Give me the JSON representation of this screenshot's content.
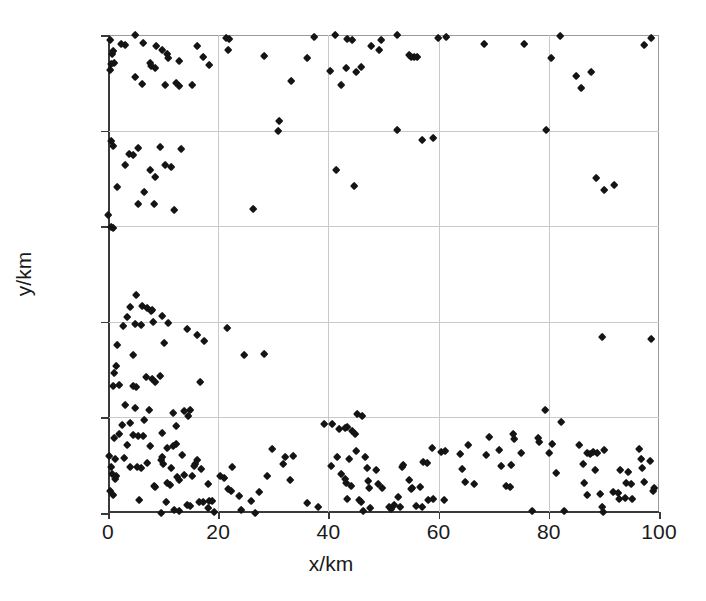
{
  "chart_data": {
    "type": "scatter",
    "title": "",
    "xlabel": "x/km",
    "ylabel": "y/km",
    "xlim": [
      0,
      100
    ],
    "ylim": [
      0,
      100
    ],
    "xticks": [
      0,
      20,
      40,
      60,
      80,
      100
    ],
    "yticks": [
      0,
      20,
      40,
      60,
      80,
      100
    ],
    "xticklabels": [
      "0",
      "20",
      "40",
      "60",
      "80",
      "100"
    ],
    "yticklabels": [
      "0",
      "20",
      "40",
      "60",
      "80",
      "100"
    ],
    "grid": true,
    "legend": null,
    "marker": "diamond",
    "marker_color": "#141414",
    "n_points": 303,
    "series": [
      {
        "name": "points",
        "points": [
          [
            0.4,
            99.0
          ],
          [
            0.9,
            96.6
          ],
          [
            0.7,
            95.9
          ],
          [
            1.1,
            94.2
          ],
          [
            0.5,
            93.8
          ],
          [
            0.4,
            92.6
          ],
          [
            2.4,
            98.0
          ],
          [
            3.2,
            97.9
          ],
          [
            4.9,
            100.0
          ],
          [
            6.3,
            98.2
          ],
          [
            8.8,
            97.6
          ],
          [
            9.9,
            96.8
          ],
          [
            10.8,
            95.9
          ],
          [
            11.0,
            95.2
          ],
          [
            7.7,
            94.2
          ],
          [
            7.9,
            93.4
          ],
          [
            8.6,
            93.0
          ],
          [
            12.9,
            94.6
          ],
          [
            16.2,
            97.6
          ],
          [
            17.3,
            95.4
          ],
          [
            18.4,
            93.6
          ],
          [
            21.4,
            99.4
          ],
          [
            22.0,
            99.2
          ],
          [
            21.8,
            96.8
          ],
          [
            5.0,
            91.2
          ],
          [
            6.2,
            89.7
          ],
          [
            10.3,
            89.4
          ],
          [
            12.4,
            90.0
          ],
          [
            15.2,
            89.6
          ],
          [
            12.9,
            89.2
          ],
          [
            28.4,
            95.6
          ],
          [
            33.3,
            90.3
          ],
          [
            37.4,
            99.5
          ],
          [
            36.2,
            95.2
          ],
          [
            41.3,
            100.0
          ],
          [
            43.5,
            99.2
          ],
          [
            44.4,
            98.9
          ],
          [
            47.8,
            97.6
          ],
          [
            49.6,
            99.0
          ],
          [
            49.3,
            96.9
          ],
          [
            43.2,
            93.0
          ],
          [
            46.0,
            93.2
          ],
          [
            52.4,
            100.0
          ],
          [
            59.9,
            99.4
          ],
          [
            61.3,
            99.5
          ],
          [
            54.6,
            95.7
          ],
          [
            55.0,
            95.3
          ],
          [
            55.6,
            95.4
          ],
          [
            56.2,
            95.4
          ],
          [
            68.2,
            98.0
          ],
          [
            75.5,
            98.0
          ],
          [
            82.0,
            99.7
          ],
          [
            80.4,
            95.1
          ],
          [
            84.9,
            91.4
          ],
          [
            85.8,
            88.8
          ],
          [
            87.7,
            92.3
          ],
          [
            98.5,
            99.4
          ],
          [
            97.4,
            97.8
          ],
          [
            40.4,
            92.4
          ],
          [
            45.1,
            92.2
          ],
          [
            42.4,
            89.5
          ],
          [
            31.0,
            82.0
          ],
          [
            30.9,
            79.8
          ],
          [
            52.5,
            80.0
          ],
          [
            79.6,
            80.1
          ],
          [
            57.0,
            78.0
          ],
          [
            59.0,
            78.4
          ],
          [
            0.5,
            77.8
          ],
          [
            1.0,
            76.7
          ],
          [
            5.4,
            76.3
          ],
          [
            9.5,
            76.6
          ],
          [
            13.2,
            76.2
          ],
          [
            3.9,
            75.0
          ],
          [
            4.6,
            74.8
          ],
          [
            3.1,
            72.8
          ],
          [
            10.4,
            72.8
          ],
          [
            11.5,
            72.4
          ],
          [
            7.6,
            71.8
          ],
          [
            8.6,
            70.3
          ],
          [
            41.4,
            71.8
          ],
          [
            1.7,
            68.2
          ],
          [
            6.6,
            67.2
          ],
          [
            44.6,
            68.4
          ],
          [
            5.4,
            64.6
          ],
          [
            8.4,
            64.6
          ],
          [
            12.0,
            63.4
          ],
          [
            26.4,
            63.6
          ],
          [
            0.1,
            62.2
          ],
          [
            0.5,
            59.8
          ],
          [
            0.9,
            59.6
          ],
          [
            88.6,
            70.0
          ],
          [
            90.0,
            67.5
          ],
          [
            91.8,
            68.6
          ],
          [
            5.2,
            45.6
          ],
          [
            4.0,
            43.0
          ],
          [
            6.2,
            43.2
          ],
          [
            7.1,
            42.8
          ],
          [
            8.0,
            42.4
          ],
          [
            7.9,
            42.2
          ],
          [
            3.5,
            41.0
          ],
          [
            9.8,
            41.2
          ],
          [
            2.8,
            39.0
          ],
          [
            5.0,
            39.4
          ],
          [
            6.0,
            39.3
          ],
          [
            8.2,
            39.9
          ],
          [
            11.0,
            39.8
          ],
          [
            14.3,
            38.4
          ],
          [
            16.2,
            37.3
          ],
          [
            21.7,
            38.6
          ],
          [
            1.6,
            35.2
          ],
          [
            10.2,
            35.6
          ],
          [
            17.5,
            35.9
          ],
          [
            4.6,
            33.0
          ],
          [
            24.7,
            33.0
          ],
          [
            28.3,
            33.3
          ],
          [
            1.4,
            30.7
          ],
          [
            1.2,
            29.2
          ],
          [
            7.0,
            28.4
          ],
          [
            8.0,
            28.0
          ],
          [
            9.4,
            28.7
          ],
          [
            1.0,
            26.6
          ],
          [
            2.0,
            26.8
          ],
          [
            4.6,
            26.5
          ],
          [
            5.2,
            26.3
          ],
          [
            8.5,
            27.3
          ],
          [
            16.8,
            27.3
          ],
          [
            89.6,
            36.8
          ],
          [
            98.6,
            36.3
          ],
          [
            3.1,
            22.5
          ],
          [
            5.0,
            22.0
          ],
          [
            7.5,
            21.6
          ],
          [
            11.8,
            20.8
          ],
          [
            13.8,
            21.2
          ],
          [
            14.9,
            21.5
          ],
          [
            14.5,
            20.3
          ],
          [
            6.6,
            19.5
          ],
          [
            79.4,
            21.6
          ],
          [
            45.3,
            20.7
          ],
          [
            40.7,
            18.6
          ],
          [
            43.4,
            17.9
          ],
          [
            44.3,
            17.2
          ],
          [
            2.6,
            18.4
          ],
          [
            4.0,
            18.7
          ],
          [
            12.4,
            18.2
          ],
          [
            2.0,
            16.4
          ],
          [
            4.6,
            16.2
          ],
          [
            5.5,
            16.1
          ],
          [
            6.3,
            16.0
          ],
          [
            9.9,
            16.6
          ],
          [
            1.2,
            15.6
          ],
          [
            3.4,
            14.2
          ],
          [
            7.6,
            14.0
          ],
          [
            10.8,
            13.6
          ],
          [
            11.8,
            13.9
          ],
          [
            12.4,
            14.5
          ],
          [
            0.3,
            11.8
          ],
          [
            1.3,
            11.2
          ],
          [
            2.9,
            11.4
          ],
          [
            4.0,
            9.6
          ],
          [
            5.3,
            9.5
          ],
          [
            6.0,
            9.4
          ],
          [
            7.2,
            10.4
          ],
          [
            9.6,
            11.0
          ],
          [
            9.9,
            11.6
          ],
          [
            10.1,
            10.2
          ],
          [
            11.4,
            9.4
          ],
          [
            0.6,
            9.5
          ],
          [
            0.8,
            8.2
          ],
          [
            1.4,
            7.6
          ],
          [
            1.3,
            7.0
          ],
          [
            8.3,
            5.6
          ],
          [
            8.6,
            5.4
          ],
          [
            10.8,
            6.3
          ],
          [
            11.3,
            5.8
          ],
          [
            0.4,
            4.6
          ],
          [
            1.0,
            3.8
          ],
          [
            5.6,
            2.6
          ],
          [
            9.6,
            0.0
          ],
          [
            12.0,
            0.6
          ],
          [
            13.0,
            0.3
          ],
          [
            14.4,
            1.6
          ],
          [
            15.0,
            1.4
          ],
          [
            15.6,
            9.8
          ],
          [
            15.9,
            10.2
          ],
          [
            16.1,
            11.0
          ],
          [
            15.2,
            7.6
          ],
          [
            17.0,
            9.2
          ],
          [
            18.2,
            6.0
          ],
          [
            16.6,
            2.2
          ],
          [
            17.2,
            2.2
          ],
          [
            18.3,
            2.4
          ],
          [
            18.2,
            1.0
          ],
          [
            18.9,
            2.4
          ],
          [
            19.2,
            0.2
          ],
          [
            20.4,
            7.6
          ],
          [
            21.0,
            7.2
          ],
          [
            22.5,
            9.5
          ],
          [
            21.8,
            5.0
          ],
          [
            22.4,
            4.6
          ],
          [
            23.8,
            3.6
          ],
          [
            26.0,
            2.4
          ],
          [
            26.8,
            0.0
          ],
          [
            29.8,
            13.4
          ],
          [
            32.2,
            11.6
          ],
          [
            33.6,
            11.8
          ],
          [
            31.8,
            10.2
          ],
          [
            28.8,
            7.8
          ],
          [
            33.0,
            6.8
          ],
          [
            27.4,
            4.4
          ],
          [
            39.2,
            18.5
          ],
          [
            42.0,
            17.6
          ],
          [
            43.1,
            17.8
          ],
          [
            40.5,
            9.8
          ],
          [
            41.6,
            11.6
          ],
          [
            42.4,
            8.2
          ],
          [
            43.0,
            7.0
          ],
          [
            43.2,
            6.2
          ],
          [
            44.2,
            5.6
          ],
          [
            45.6,
            2.6
          ],
          [
            46.0,
            2.2
          ],
          [
            46.4,
            0.4
          ],
          [
            47.6,
            1.0
          ],
          [
            43.4,
            2.8
          ],
          [
            48.7,
            8.9
          ],
          [
            49.0,
            6.1
          ],
          [
            49.8,
            5.1
          ],
          [
            51.0,
            1.3
          ],
          [
            51.4,
            0.9
          ],
          [
            52.0,
            1.6
          ],
          [
            52.6,
            3.4
          ],
          [
            53.0,
            1.2
          ],
          [
            54.6,
            6.8
          ],
          [
            55.2,
            5.2
          ],
          [
            55.0,
            4.9
          ],
          [
            56.6,
            5.4
          ],
          [
            57.2,
            10.6
          ],
          [
            58.0,
            10.4
          ],
          [
            58.8,
            13.6
          ],
          [
            60.4,
            12.8
          ],
          [
            61.2,
            12.9
          ],
          [
            53.6,
            10.0
          ],
          [
            53.4,
            9.6
          ],
          [
            56.0,
            1.4
          ],
          [
            57.0,
            1.2
          ],
          [
            58.2,
            2.6
          ],
          [
            59.0,
            2.8
          ],
          [
            61.0,
            2.6
          ],
          [
            64.0,
            12.4
          ],
          [
            64.2,
            9.2
          ],
          [
            65.4,
            14.2
          ],
          [
            64.9,
            6.4
          ],
          [
            66.4,
            6.0
          ],
          [
            69.2,
            15.8
          ],
          [
            68.6,
            12.0
          ],
          [
            71.0,
            13.2
          ],
          [
            71.4,
            9.8
          ],
          [
            72.2,
            5.6
          ],
          [
            73.0,
            5.4
          ],
          [
            73.6,
            16.5
          ],
          [
            73.8,
            15.4
          ],
          [
            73.2,
            10.0
          ],
          [
            75.0,
            12.6
          ],
          [
            78.0,
            15.6
          ],
          [
            78.2,
            14.8
          ],
          [
            77.0,
            0.4
          ],
          [
            80.6,
            14.4
          ],
          [
            82.2,
            19.0
          ],
          [
            80.0,
            12.6
          ],
          [
            82.8,
            0.3
          ],
          [
            81.4,
            8.4
          ],
          [
            85.6,
            14.2
          ],
          [
            86.2,
            10.3
          ],
          [
            87.0,
            12.6
          ],
          [
            87.6,
            12.4
          ],
          [
            88.0,
            12.8
          ],
          [
            88.8,
            12.6
          ],
          [
            86.4,
            6.2
          ],
          [
            87.0,
            3.8
          ],
          [
            88.4,
            9.0
          ],
          [
            89.4,
            4.0
          ],
          [
            90.0,
            13.2
          ],
          [
            89.8,
            0.2
          ],
          [
            89.6,
            1.2
          ],
          [
            91.6,
            4.4
          ],
          [
            92.6,
            4.2
          ],
          [
            92.8,
            2.8
          ],
          [
            93.8,
            3.0
          ],
          [
            94.4,
            8.6
          ],
          [
            94.0,
            6.2
          ],
          [
            95.0,
            6.0
          ],
          [
            93.0,
            9.0
          ],
          [
            95.2,
            2.8
          ],
          [
            96.4,
            13.4
          ],
          [
            96.8,
            11.2
          ],
          [
            97.0,
            9.4
          ],
          [
            97.4,
            6.4
          ],
          [
            98.4,
            10.8
          ],
          [
            99.0,
            4.6
          ],
          [
            99.2,
            5.2
          ],
          [
            46.2,
            20.2
          ],
          [
            44.8,
            16.4
          ],
          [
            45.0,
            13.0
          ],
          [
            46.6,
            11.6
          ],
          [
            47.0,
            9.4
          ],
          [
            47.2,
            6.6
          ],
          [
            47.4,
            5.2
          ],
          [
            43.8,
            11.2
          ],
          [
            36.2,
            2.0
          ],
          [
            38.2,
            1.2
          ],
          [
            24.2,
            0.5
          ],
          [
            10.5,
            2.2
          ],
          [
            12.6,
            7.4
          ],
          [
            12.9,
            6.8
          ],
          [
            13.4,
            12.0
          ],
          [
            13.9,
            8.0
          ]
        ]
      }
    ]
  },
  "axes": {
    "x_title": "x/km",
    "y_title": "y/km",
    "x_ticks": [
      "0",
      "20",
      "40",
      "60",
      "80",
      "100"
    ],
    "y_ticks": [
      "0",
      "20",
      "40",
      "60",
      "80",
      "100"
    ]
  },
  "style": {
    "background": "#ffffff",
    "marker_color": "#141414",
    "grid_color": "#c9c9c9",
    "axis_color": "#3a3a3a",
    "text_color": "#1a1a1a"
  }
}
